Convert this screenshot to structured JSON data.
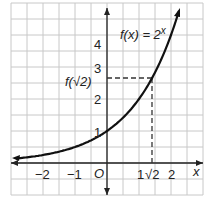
{
  "chart_data": {
    "type": "line",
    "title": "",
    "function_label": "f(x) = 2^x",
    "function_label_base": "f(x) = 2",
    "function_label_exp": "x",
    "xlabel": "x",
    "ylabel": "",
    "origin_label": "O",
    "xlim": [
      -2.9,
      3.0
    ],
    "ylim": [
      -0.9,
      4.9
    ],
    "grid": true,
    "grid_step": 0.5,
    "x_ticks": [
      "−2",
      "−1",
      "1",
      "2"
    ],
    "y_ticks": [
      "1",
      "2",
      "3",
      "4"
    ],
    "annotation_x": "√2",
    "annotation_y": "f(√2)",
    "annotation_point": [
      1.414,
      2.665
    ],
    "series": [
      {
        "name": "f(x) = 2^x",
        "x": [
          -3,
          -2,
          -1,
          0,
          1,
          1.414,
          2,
          2.6
        ],
        "y": [
          0.125,
          0.25,
          0.5,
          1,
          2,
          2.665,
          4,
          6.06
        ]
      }
    ],
    "colors": {
      "curve": "#111111",
      "grid": "#c8c8c8",
      "axis": "#222222"
    }
  }
}
